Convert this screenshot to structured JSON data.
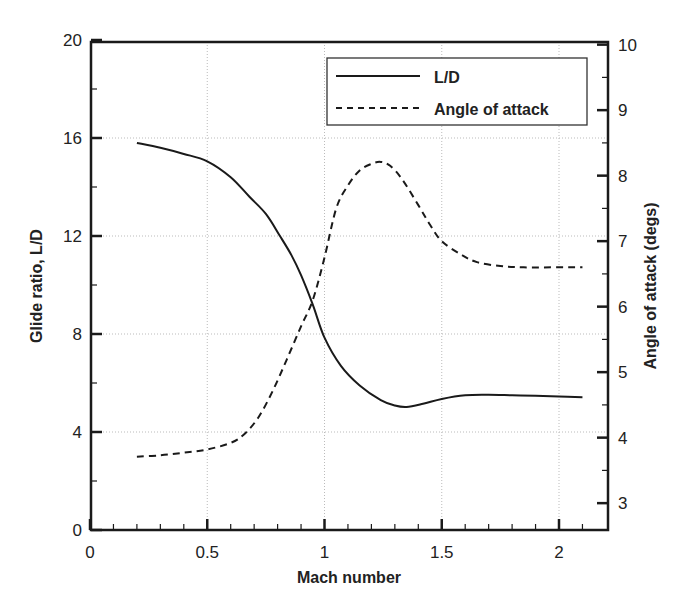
{
  "chart_data": {
    "type": "line",
    "title": "",
    "xlabel": "Mach number",
    "ylabel": "Glide ratio, L/D",
    "y2label": "Angle of attack (degs)",
    "xlim": [
      0,
      2.2
    ],
    "ylim": [
      0,
      20
    ],
    "y2lim": [
      2.59,
      10
    ],
    "grid": true,
    "legend_position": "upper right",
    "x_ticks": [
      "0",
      "0.5",
      "1",
      "1.5",
      "2"
    ],
    "y_ticks": [
      "0",
      "4",
      "8",
      "12",
      "16",
      "20"
    ],
    "y2_ticks": [
      "3",
      "4",
      "5",
      "6",
      "7",
      "8",
      "9",
      "10"
    ],
    "series": [
      {
        "name": "L/D",
        "axis": "left",
        "style": "solid",
        "x": [
          0.2,
          0.3,
          0.4,
          0.5,
          0.6,
          0.68,
          0.75,
          0.81,
          0.86,
          0.9,
          0.95,
          1.0,
          1.07,
          1.15,
          1.24,
          1.3,
          1.35,
          1.42,
          1.5,
          1.6,
          1.7,
          1.8,
          1.9,
          2.0,
          2.1
        ],
        "values": [
          15.8,
          15.6,
          15.35,
          15.05,
          14.4,
          13.6,
          12.9,
          12.0,
          11.2,
          10.4,
          9.2,
          7.85,
          6.7,
          5.9,
          5.3,
          5.08,
          5.02,
          5.15,
          5.35,
          5.5,
          5.52,
          5.5,
          5.48,
          5.45,
          5.42
        ]
      },
      {
        "name": "Angle of attack",
        "axis": "right",
        "style": "dashed",
        "x": [
          0.2,
          0.3,
          0.4,
          0.5,
          0.6,
          0.66,
          0.72,
          0.78,
          0.84,
          0.9,
          0.95,
          1.0,
          1.05,
          1.1,
          1.15,
          1.2,
          1.24,
          1.28,
          1.33,
          1.4,
          1.45,
          1.5,
          1.58,
          1.65,
          1.75,
          1.85,
          2.0,
          2.1
        ],
        "values": [
          3.71,
          3.73,
          3.77,
          3.82,
          3.92,
          4.06,
          4.32,
          4.72,
          5.2,
          5.7,
          6.1,
          6.75,
          7.5,
          7.85,
          8.08,
          8.18,
          8.21,
          8.15,
          7.95,
          7.55,
          7.25,
          7.0,
          6.8,
          6.68,
          6.62,
          6.6,
          6.6,
          6.6
        ]
      }
    ]
  },
  "legend": {
    "items": [
      {
        "label": "L/D"
      },
      {
        "label": "Angle of attack"
      }
    ]
  }
}
